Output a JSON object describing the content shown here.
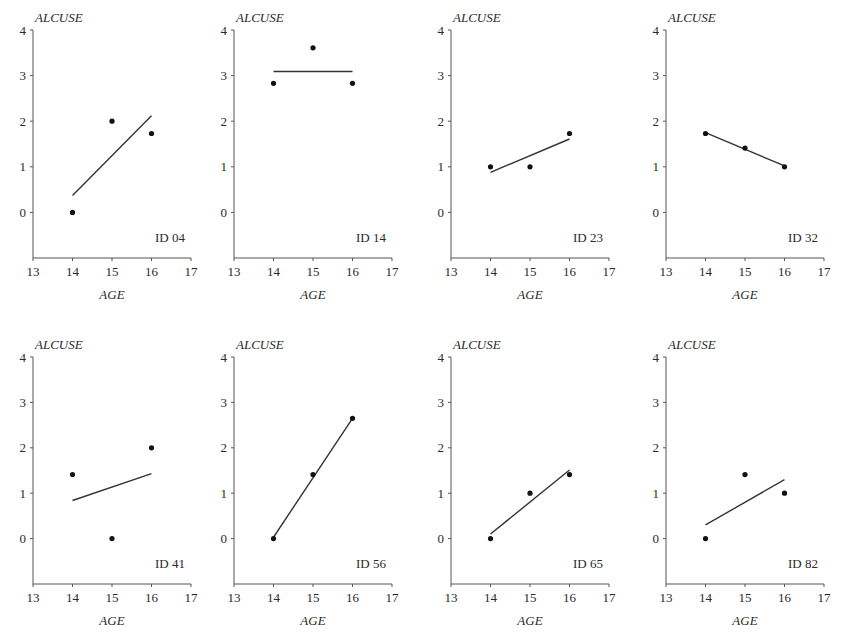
{
  "chart_data": [
    {
      "type": "scatter",
      "title": "ID 04",
      "xlabel": "AGE",
      "ylabel": "ALCUSE",
      "xlim": [
        13,
        17
      ],
      "ylim": [
        -1,
        4
      ],
      "xticks": [
        "13",
        "14",
        "15",
        "16",
        "17"
      ],
      "yticks": [
        "0",
        "1",
        "2",
        "3",
        "4"
      ],
      "points": {
        "x": [
          14,
          15,
          16
        ],
        "y": [
          0,
          2,
          1.73
        ]
      },
      "fit_line": {
        "x": [
          14,
          16
        ],
        "y": [
          0.37,
          2.12
        ]
      }
    },
    {
      "type": "scatter",
      "title": "ID 14",
      "xlabel": "AGE",
      "ylabel": "ALCUSE",
      "xlim": [
        13,
        17
      ],
      "ylim": [
        -1,
        4
      ],
      "xticks": [
        "13",
        "14",
        "15",
        "16",
        "17"
      ],
      "yticks": [
        "0",
        "1",
        "2",
        "3",
        "4"
      ],
      "points": {
        "x": [
          14,
          15,
          16
        ],
        "y": [
          2.83,
          3.61,
          2.83
        ]
      },
      "fit_line": {
        "x": [
          14,
          16
        ],
        "y": [
          3.09,
          3.09
        ]
      }
    },
    {
      "type": "scatter",
      "title": "ID 23",
      "xlabel": "AGE",
      "ylabel": "ALCUSE",
      "xlim": [
        13,
        17
      ],
      "ylim": [
        -1,
        4
      ],
      "xticks": [
        "13",
        "14",
        "15",
        "16",
        "17"
      ],
      "yticks": [
        "0",
        "1",
        "2",
        "3",
        "4"
      ],
      "points": {
        "x": [
          14,
          15,
          16
        ],
        "y": [
          1,
          1,
          1.73
        ]
      },
      "fit_line": {
        "x": [
          14,
          16
        ],
        "y": [
          0.88,
          1.61
        ]
      }
    },
    {
      "type": "scatter",
      "title": "ID 32",
      "xlabel": "AGE",
      "ylabel": "ALCUSE",
      "xlim": [
        13,
        17
      ],
      "ylim": [
        -1,
        4
      ],
      "xticks": [
        "13",
        "14",
        "15",
        "16",
        "17"
      ],
      "yticks": [
        "0",
        "1",
        "2",
        "3",
        "4"
      ],
      "points": {
        "x": [
          14,
          15,
          16
        ],
        "y": [
          1.73,
          1.41,
          1.0
        ]
      },
      "fit_line": {
        "x": [
          14,
          16
        ],
        "y": [
          1.75,
          1.02
        ]
      }
    },
    {
      "type": "scatter",
      "title": "ID 41",
      "xlabel": "AGE",
      "ylabel": "ALCUSE",
      "xlim": [
        13,
        17
      ],
      "ylim": [
        -1,
        4
      ],
      "xticks": [
        "13",
        "14",
        "15",
        "16",
        "17"
      ],
      "yticks": [
        "0",
        "1",
        "2",
        "3",
        "4"
      ],
      "points": {
        "x": [
          14,
          15,
          16
        ],
        "y": [
          1.41,
          0,
          2
        ]
      },
      "fit_line": {
        "x": [
          14,
          16
        ],
        "y": [
          0.84,
          1.43
        ]
      }
    },
    {
      "type": "scatter",
      "title": "ID 56",
      "xlabel": "AGE",
      "ylabel": "ALCUSE",
      "xlim": [
        13,
        17
      ],
      "ylim": [
        -1,
        4
      ],
      "xticks": [
        "13",
        "14",
        "15",
        "16",
        "17"
      ],
      "yticks": [
        "0",
        "1",
        "2",
        "3",
        "4"
      ],
      "points": {
        "x": [
          14,
          15,
          16
        ],
        "y": [
          0,
          1.41,
          2.65
        ]
      },
      "fit_line": {
        "x": [
          14,
          16
        ],
        "y": [
          0.03,
          2.65
        ]
      }
    },
    {
      "type": "scatter",
      "title": "ID 65",
      "xlabel": "AGE",
      "ylabel": "ALCUSE",
      "xlim": [
        13,
        17
      ],
      "ylim": [
        -1,
        4
      ],
      "xticks": [
        "13",
        "14",
        "15",
        "16",
        "17"
      ],
      "yticks": [
        "0",
        "1",
        "2",
        "3",
        "4"
      ],
      "points": {
        "x": [
          14,
          15,
          16
        ],
        "y": [
          0,
          1,
          1.41
        ]
      },
      "fit_line": {
        "x": [
          14,
          16
        ],
        "y": [
          0.1,
          1.51
        ]
      }
    },
    {
      "type": "scatter",
      "title": "ID 82",
      "xlabel": "AGE",
      "ylabel": "ALCUSE",
      "xlim": [
        13,
        17
      ],
      "ylim": [
        -1,
        4
      ],
      "xticks": [
        "13",
        "14",
        "15",
        "16",
        "17"
      ],
      "yticks": [
        "0",
        "1",
        "2",
        "3",
        "4"
      ],
      "points": {
        "x": [
          14,
          15,
          16
        ],
        "y": [
          0,
          1.41,
          1.0
        ]
      },
      "fit_line": {
        "x": [
          14,
          16
        ],
        "y": [
          0.3,
          1.3
        ]
      }
    }
  ]
}
